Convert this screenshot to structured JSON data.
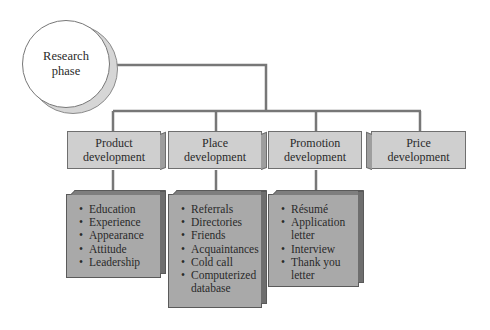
{
  "root": {
    "label_line1": "Research",
    "label_line2": "phase"
  },
  "branches": [
    {
      "title_line1": "Product",
      "title_line2": "development",
      "items": [
        "Education",
        "Experience",
        "Appearance",
        "Attitude",
        "Leadership"
      ]
    },
    {
      "title_line1": "Place",
      "title_line2": "development",
      "items": [
        "Referrals",
        "Directories",
        "Friends",
        "Acquaintances",
        "Cold call",
        "Computerized database"
      ]
    },
    {
      "title_line1": "Promotion",
      "title_line2": "development",
      "items": [
        "Résumé",
        "Application letter",
        "Interview",
        "Thank you letter"
      ]
    },
    {
      "title_line1": "Price",
      "title_line2": "development",
      "items": []
    }
  ],
  "colors": {
    "connector": "#777777",
    "header_box": "#cfcfcf",
    "list_box": "#a9a9a9",
    "circle_shadow": "#d6d6d6"
  }
}
